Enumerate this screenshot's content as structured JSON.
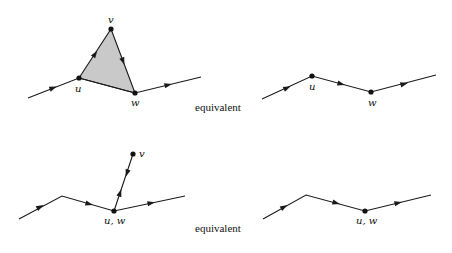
{
  "figure": {
    "colors": {
      "stroke": "#1a1a1a",
      "face_fill": "#c9c9c9",
      "background": "#ffffff"
    },
    "rows": [
      {
        "id": "top",
        "left": {
          "path": [
            [
              28,
              98
            ],
            [
              79,
              78
            ],
            [
              135,
              93
            ],
            [
              201,
              77
            ]
          ],
          "triangle": {
            "u": [
              79,
              78
            ],
            "v": [
              111,
              29
            ],
            "w": [
              135,
              93
            ]
          },
          "vertices": [
            {
              "name": "u",
              "label": "u",
              "pos": [
                79,
                78
              ],
              "label_pos": [
                75,
                92
              ]
            },
            {
              "name": "v",
              "label": "v",
              "pos": [
                111,
                29
              ],
              "label_pos": [
                108,
                23
              ]
            },
            {
              "name": "w",
              "label": "w",
              "pos": [
                135,
                93
              ],
              "label_pos": [
                131,
                106
              ]
            }
          ],
          "arrows": [
            {
              "at": [
                53,
                88
              ],
              "dir": [
                51,
                -20
              ]
            },
            {
              "at": [
                95,
                54
              ],
              "dir": [
                32,
                -49
              ]
            },
            {
              "at": [
                123,
                61
              ],
              "dir": [
                24,
                64
              ]
            },
            {
              "at": [
                168,
                85
              ],
              "dir": [
                66,
                -16
              ]
            }
          ]
        },
        "relation": {
          "text": "equivalent",
          "pos": [
            195,
            111
          ]
        },
        "right": {
          "path": [
            [
              262,
              99
            ],
            [
              312,
              76
            ],
            [
              371,
              92
            ],
            [
              436,
              75
            ]
          ],
          "vertices": [
            {
              "name": "u",
              "label": "u",
              "pos": [
                312,
                76
              ],
              "label_pos": [
                309,
                90
              ]
            },
            {
              "name": "w",
              "label": "w",
              "pos": [
                371,
                92
              ],
              "label_pos": [
                368,
                106
              ]
            }
          ],
          "arrows": [
            {
              "at": [
                287,
                88
              ],
              "dir": [
                50,
                -23
              ]
            },
            {
              "at": [
                341,
                84
              ],
              "dir": [
                59,
                16
              ]
            },
            {
              "at": [
                404,
                84
              ],
              "dir": [
                65,
                -17
              ]
            }
          ]
        }
      },
      {
        "id": "bottom",
        "left": {
          "path": [
            [
              19,
              219
            ],
            [
              62,
              196
            ],
            [
              114,
              211
            ],
            [
              185,
              196
            ]
          ],
          "spur": {
            "from": [
              114,
              211
            ],
            "to": [
              133,
              154
            ]
          },
          "vertices": [
            {
              "name": "u,w",
              "label": "u, w",
              "pos": [
                114,
                211
              ],
              "label_pos": [
                104,
                224
              ]
            },
            {
              "name": "v",
              "label": "v",
              "pos": [
                133,
                154
              ],
              "label_pos": [
                139,
                157
              ]
            }
          ],
          "arrows": [
            {
              "at": [
                40,
                207
              ],
              "dir": [
                43,
                -23
              ]
            },
            {
              "at": [
                89,
                204
              ],
              "dir": [
                52,
                15
              ]
            },
            {
              "at": [
                151,
                203
              ],
              "dir": [
                71,
                -15
              ]
            },
            {
              "at": [
                127,
                173
              ],
              "dir": [
                -6,
                18
              ]
            },
            {
              "at": [
                120,
                193
              ],
              "dir": [
                6,
                -18
              ]
            }
          ]
        },
        "relation": {
          "text": "equivalent",
          "pos": [
            195,
            232
          ]
        },
        "right": {
          "path": [
            [
              263,
              219
            ],
            [
              306,
              195
            ],
            [
              365,
              211
            ],
            [
              431,
              195
            ]
          ],
          "vertices": [
            {
              "name": "u,w",
              "label": "u, w",
              "pos": [
                365,
                211
              ],
              "label_pos": [
                356,
                224
              ]
            }
          ],
          "arrows": [
            {
              "at": [
                284,
                207
              ],
              "dir": [
                43,
                -24
              ]
            },
            {
              "at": [
                336,
                203
              ],
              "dir": [
                59,
                16
              ]
            },
            {
              "at": [
                398,
                203
              ],
              "dir": [
                66,
                -16
              ]
            }
          ]
        }
      }
    ]
  }
}
